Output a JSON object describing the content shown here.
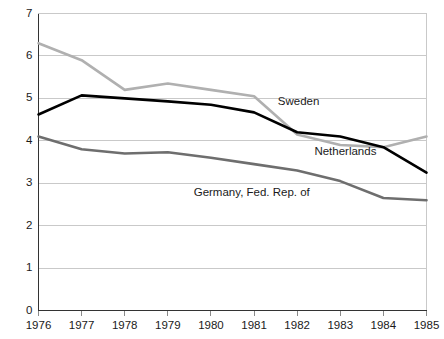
{
  "chart_data": {
    "type": "line",
    "title": "",
    "subtitle": "",
    "xlabel": "",
    "ylabel": "",
    "x": [
      1976,
      1977,
      1978,
      1979,
      1980,
      1981,
      1982,
      1983,
      1984,
      1985
    ],
    "categories": [
      "1976",
      "1977",
      "1978",
      "1979",
      "1980",
      "1981",
      "1982",
      "1983",
      "1984",
      "1985"
    ],
    "xlim": [
      1976,
      1985
    ],
    "ylim": [
      0,
      7
    ],
    "yticks": [
      0,
      1,
      2,
      3,
      4,
      5,
      6,
      7
    ],
    "ytick_labels": [
      "0",
      "1",
      "2",
      "3",
      "4",
      "5",
      "6",
      "7"
    ],
    "grid": "horizontal",
    "legend_position": "inline-annotations",
    "series": [
      {
        "name": "Sweden",
        "color": "#b0b0b0",
        "values": [
          6.3,
          5.9,
          5.2,
          5.35,
          5.2,
          5.05,
          4.15,
          3.9,
          3.85,
          4.1
        ]
      },
      {
        "name": "Netherlands",
        "color": "#000000",
        "values": [
          4.62,
          5.07,
          5.0,
          4.93,
          4.85,
          4.67,
          4.2,
          4.1,
          3.85,
          3.25
        ]
      },
      {
        "name": "Germany, Fed. Rep. of",
        "color": "#6e6e6e",
        "values": [
          4.1,
          3.8,
          3.7,
          3.73,
          3.6,
          3.45,
          3.3,
          3.05,
          2.65,
          2.6
        ]
      }
    ],
    "annotations": [
      {
        "text": "Sweden",
        "x": 1981.55,
        "y": 4.92
      },
      {
        "text": "Netherlands",
        "x": 1982.4,
        "y": 3.74
      },
      {
        "text": "Germany, Fed. Rep. of",
        "x": 1979.6,
        "y": 2.78
      }
    ]
  },
  "colors": {
    "background": "#ffffff",
    "axis": "#333333",
    "gridline": "#c9c9c9",
    "text": "#1a1a1a",
    "sweden": "#b0b0b0",
    "netherlands": "#000000",
    "germany": "#6e6e6e"
  }
}
